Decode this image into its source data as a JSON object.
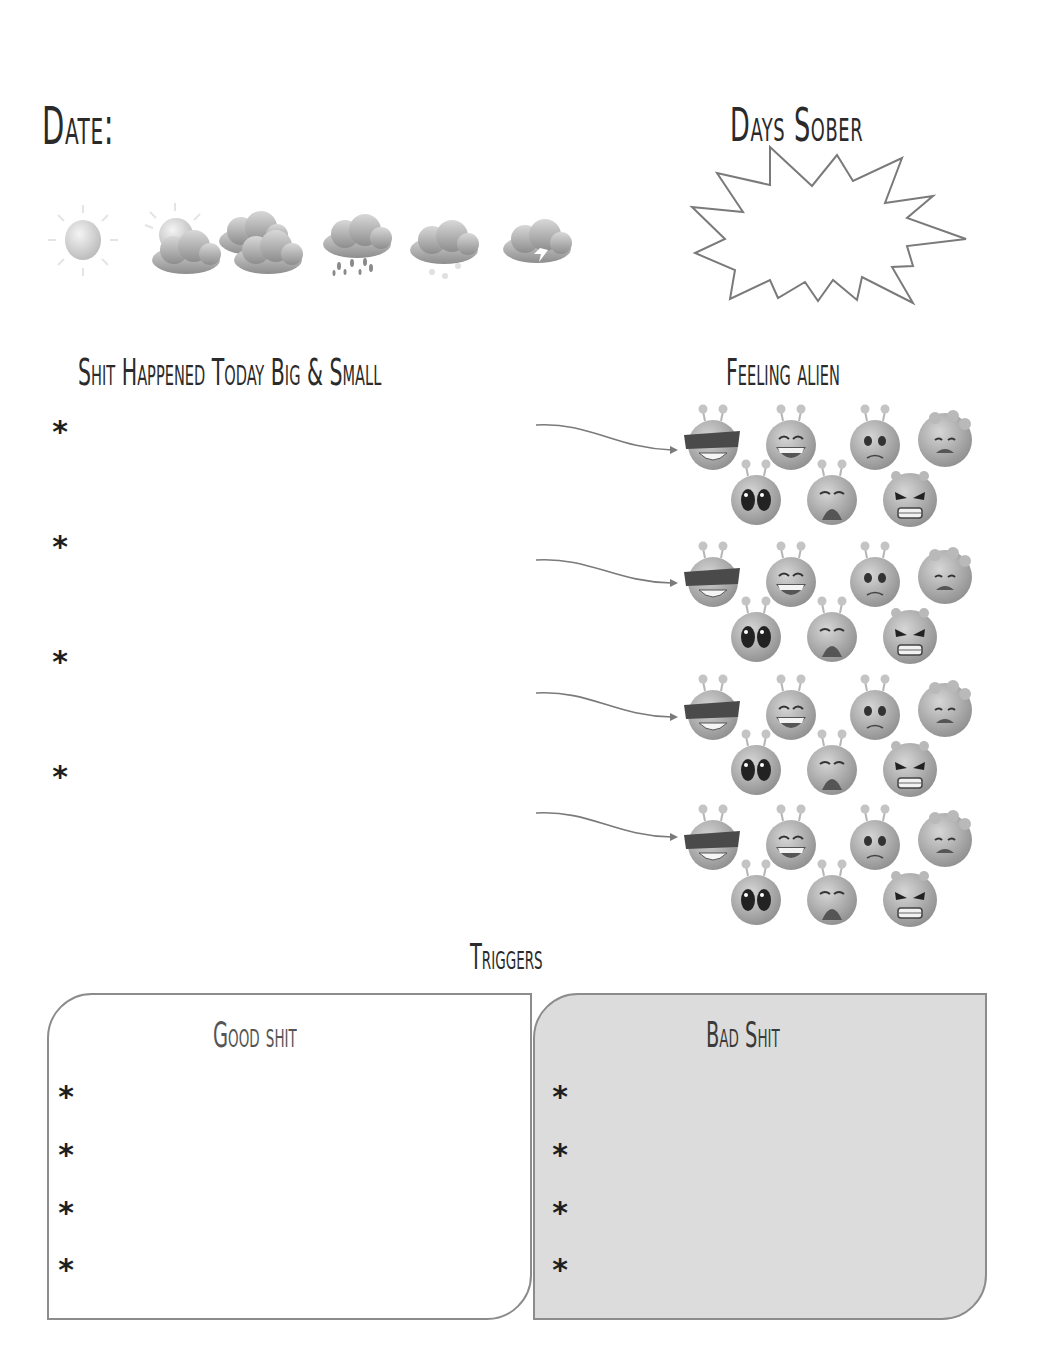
{
  "header": {
    "date_label": "Date:",
    "days_sober_label": "Days Sober"
  },
  "weather": {
    "icons": [
      "sunny-icon",
      "partly-cloudy-icon",
      "cloudy-icon",
      "rain-icon",
      "snow-icon",
      "thunderstorm-icon"
    ]
  },
  "events_section": {
    "title": "Shit Happened Today Big & Small",
    "bullet": "*",
    "entries": [
      "",
      "",
      "",
      ""
    ]
  },
  "feelings_section": {
    "title": "Feeling alien",
    "moods": [
      "cool",
      "laughing",
      "worried",
      "sad",
      "shocked",
      "crying",
      "angry"
    ],
    "group_count": 4
  },
  "triggers": {
    "title": "Triggers",
    "good": {
      "title": "Good shit",
      "bullet": "*",
      "entries": [
        "",
        "",
        "",
        ""
      ]
    },
    "bad": {
      "title": "Bad Shit",
      "bullet": "*",
      "entries": [
        "",
        "",
        "",
        ""
      ]
    }
  },
  "colors": {
    "ink": "#2b2b2b",
    "outline": "#8c8c8c",
    "bad_fill": "#dcdcdc",
    "icon_gray": "#a8a8a8"
  }
}
